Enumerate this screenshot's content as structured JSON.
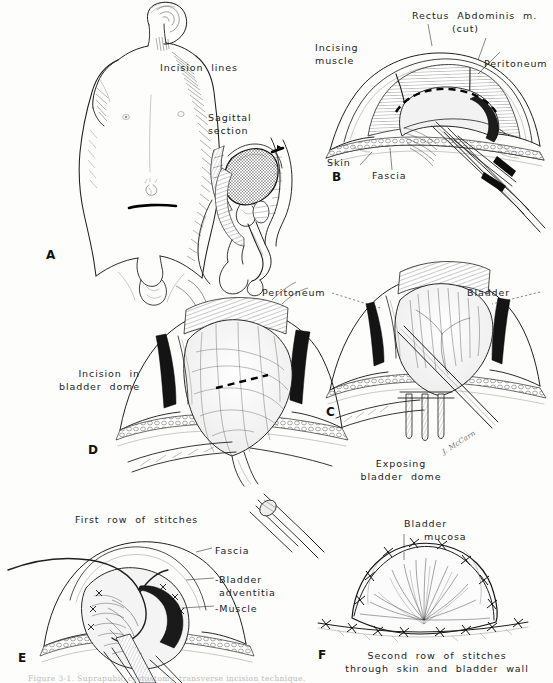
{
  "plate": {
    "title": "Suprapubic cystostomy — operative technique plate",
    "background_color": "#fdfdfc",
    "ink_color": "#1f1f1f",
    "artist_signature": "J. McCarn",
    "caption": "Figure 3-1.  Suprapubic cystostomy, transverse incision technique."
  },
  "panels": {
    "a": {
      "letter": "A",
      "labels": {
        "incision_lines": "Incision  lines",
        "sagittal_section": "Sagittal\nsection"
      }
    },
    "b": {
      "letter": "B",
      "labels": {
        "rectus": "Rectus  Abdominis  m.",
        "rectus_cut": "(cut)",
        "incising_muscle": "Incising\nmuscle",
        "peritoneum": "Peritoneum",
        "skin": "Skin",
        "fascia": "Fascia"
      }
    },
    "c": {
      "letter": "C",
      "labels": {
        "peritoneum": "Peritoneum",
        "bladder": "Bladder",
        "exposing": "Exposing\nbladder  dome"
      }
    },
    "d": {
      "letter": "D",
      "labels": {
        "incision_in_dome": "Incision  in\nbladder  dome"
      }
    },
    "e": {
      "letter": "E",
      "labels": {
        "first_row": "First  row  of  stitches",
        "fascia": "Fascia",
        "bladder_adventitia": "-Bladder\n adventitia",
        "muscle": "-Muscle"
      }
    },
    "f": {
      "letter": "F",
      "labels": {
        "bladder_mucosa_l1": "Bladder",
        "bladder_mucosa_l2": "mucosa",
        "second_row": "Second  row  of  stitches\nthrough  skin  and  bladder  wall"
      }
    }
  }
}
